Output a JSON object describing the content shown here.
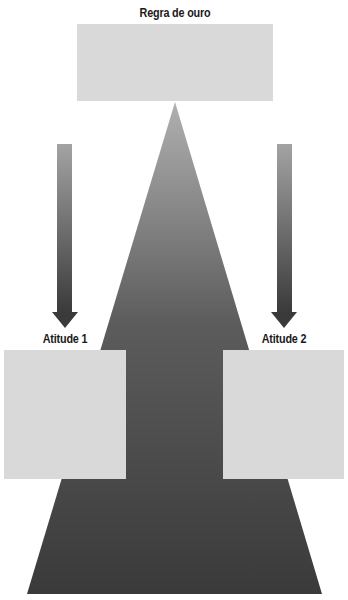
{
  "diagram": {
    "top": {
      "label": "Regra de ouro",
      "box_color": "#d9d9d9"
    },
    "left": {
      "label": "Atitude 1",
      "box_color": "#d9d9d9"
    },
    "right": {
      "label": "Atitude 2",
      "box_color": "#d9d9d9"
    },
    "triangle": {
      "gradient_top": "#a8a8a8",
      "gradient_bottom": "#3a3a3a"
    },
    "arrows": {
      "gradient_top": "#a0a0a0",
      "gradient_bottom": "#3c3c3c"
    }
  }
}
